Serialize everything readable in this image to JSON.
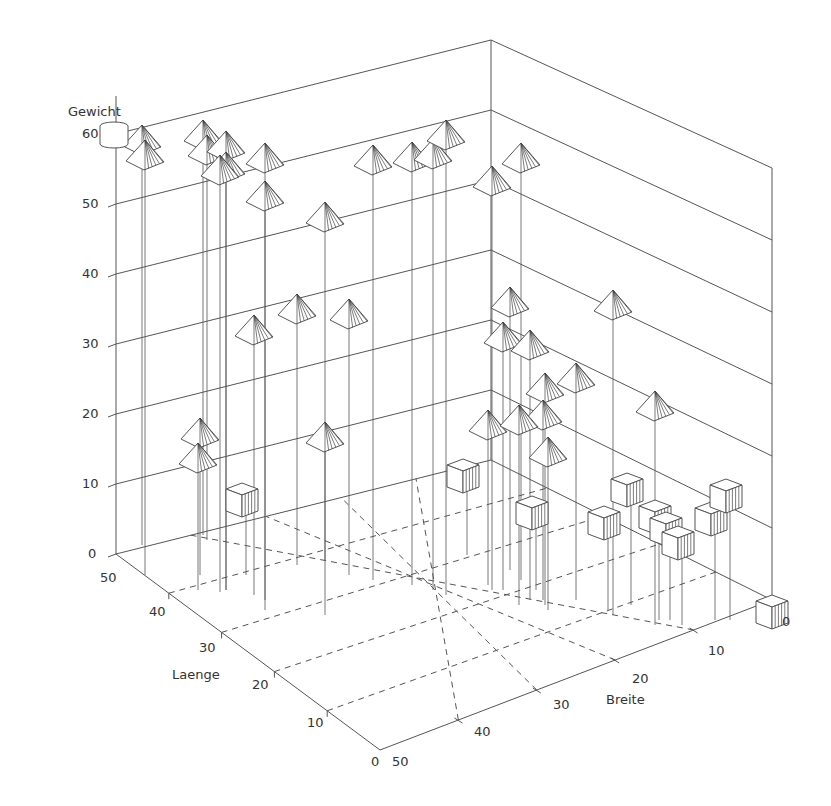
{
  "chart_data": {
    "type": "scatter3d",
    "title": "",
    "axes": {
      "z": {
        "label": "Gewicht",
        "range": [
          0,
          60
        ],
        "ticks": [
          0,
          10,
          20,
          30,
          40,
          50,
          60
        ]
      },
      "x": {
        "label": "Laenge",
        "range": [
          0,
          50
        ],
        "ticks": [
          0,
          10,
          20,
          30,
          40,
          50
        ]
      },
      "y": {
        "label": "Breite",
        "range": [
          0,
          50
        ],
        "ticks": [
          0,
          10,
          20,
          30,
          40,
          50
        ]
      }
    },
    "grid": "floor dashed grid, solid wall grid lines every 10 units",
    "legend": {
      "marker": "cylinder",
      "position": "top-left near Gewicht axis"
    },
    "series": [
      {
        "name": "pyramid",
        "marker": "pyramid",
        "points": [
          {
            "Laenge": 45,
            "Breite": 48,
            "Gewicht": 60
          },
          {
            "Laenge": 43,
            "Breite": 48,
            "Gewicht": 58
          },
          {
            "Laenge": 46,
            "Breite": 42,
            "Gewicht": 61
          },
          {
            "Laenge": 44,
            "Breite": 42,
            "Gewicht": 59
          },
          {
            "Laenge": 40,
            "Breite": 42,
            "Gewicht": 58
          },
          {
            "Laenge": 38,
            "Breite": 42,
            "Gewicht": 56
          },
          {
            "Laenge": 38,
            "Breite": 43,
            "Gewicht": 55
          },
          {
            "Laenge": 36,
            "Breite": 39,
            "Gewicht": 57
          },
          {
            "Laenge": 37,
            "Breite": 39,
            "Gewicht": 52
          },
          {
            "Laenge": 40,
            "Breite": 33,
            "Gewicht": 46
          },
          {
            "Laenge": 42,
            "Breite": 28,
            "Gewicht": 56
          },
          {
            "Laenge": 42,
            "Breite": 25,
            "Gewicht": 57
          },
          {
            "Laenge": 42,
            "Breite": 23,
            "Gewicht": 58
          },
          {
            "Laenge": 44,
            "Breite": 21,
            "Gewicht": 61
          },
          {
            "Laenge": 44,
            "Breite": 15,
            "Gewicht": 54
          },
          {
            "Laenge": 43,
            "Breite": 13,
            "Gewicht": 58
          },
          {
            "Laenge": 34,
            "Breite": 42,
            "Gewicht": 33
          },
          {
            "Laenge": 40,
            "Breite": 36,
            "Gewicht": 34
          },
          {
            "Laenge": 38,
            "Breite": 31,
            "Gewicht": 34
          },
          {
            "Laenge": 32,
            "Breite": 36,
            "Gewicht": 17
          },
          {
            "Laenge": 43,
            "Breite": 45,
            "Gewicht": 19
          },
          {
            "Laenge": 41,
            "Breite": 46,
            "Gewicht": 17
          },
          {
            "Laenge": 40,
            "Breite": 15,
            "Gewicht": 36
          },
          {
            "Laenge": 37,
            "Breite": 16,
            "Gewicht": 32
          },
          {
            "Laenge": 35,
            "Breite": 14,
            "Gewicht": 31
          },
          {
            "Laenge": 33,
            "Breite": 13,
            "Gewicht": 26
          },
          {
            "Laenge": 33,
            "Breite": 10,
            "Gewicht": 27
          },
          {
            "Laenge": 30,
            "Breite": 6,
            "Gewicht": 37
          },
          {
            "Laenge": 34,
            "Breite": 13,
            "Gewicht": 23
          },
          {
            "Laenge": 40,
            "Breite": 16,
            "Gewicht": 19
          },
          {
            "Laenge": 33,
            "Breite": 14,
            "Gewicht": 20
          },
          {
            "Laenge": 31,
            "Breite": 13,
            "Gewicht": 16
          },
          {
            "Laenge": 27,
            "Breite": 4,
            "Gewicht": 24
          }
        ]
      },
      {
        "name": "cube",
        "marker": "cube",
        "points": [
          {
            "Laenge": 40,
            "Breite": 42,
            "Gewicht": 10
          },
          {
            "Laenge": 48,
            "Breite": 18,
            "Gewicht": 10
          },
          {
            "Laenge": 38,
            "Breite": 14,
            "Gewicht": 9
          },
          {
            "Laenge": 33,
            "Breite": 6,
            "Gewicht": 13
          },
          {
            "Laenge": 30,
            "Breite": 9,
            "Gewicht": 10
          },
          {
            "Laenge": 28,
            "Breite": 5,
            "Gewicht": 11
          },
          {
            "Laenge": 27,
            "Breite": 5,
            "Gewicht": 10
          },
          {
            "Laenge": 25,
            "Breite": 5,
            "Gewicht": 9
          },
          {
            "Laenge": 22,
            "Breite": 2,
            "Gewicht": 11
          },
          {
            "Laenge": 25,
            "Breite": 1,
            "Gewicht": 13
          },
          {
            "Laenge": 0,
            "Breite": 0,
            "Gewicht": 1
          }
        ]
      }
    ]
  },
  "render": {
    "frame": {
      "floor": {
        "front": [
          380,
          750
        ],
        "left": [
          116,
          554
        ],
        "back": [
          491,
          460
        ],
        "right": [
          772,
          600
        ]
      },
      "walls_top": {
        "left": [
          116,
          134
        ],
        "back": [
          491,
          40
        ],
        "right": [
          772,
          168
        ]
      }
    },
    "z_ticks_screen": [
      {
        "label": "0",
        "x": 88,
        "y": 554
      },
      {
        "label": "10",
        "x": 82,
        "y": 484
      },
      {
        "label": "20",
        "x": 82,
        "y": 414
      },
      {
        "label": "30",
        "x": 82,
        "y": 344
      },
      {
        "label": "40",
        "x": 82,
        "y": 274
      },
      {
        "label": "50",
        "x": 82,
        "y": 204
      },
      {
        "label": "60",
        "x": 82,
        "y": 134
      }
    ],
    "laenge_ticks_screen": [
      {
        "label": "50",
        "x": 100,
        "y": 578
      },
      {
        "label": "40",
        "x": 149,
        "y": 612
      },
      {
        "label": "30",
        "x": 199,
        "y": 648
      },
      {
        "label": "20",
        "x": 252,
        "y": 685
      },
      {
        "label": "10",
        "x": 307,
        "y": 723
      },
      {
        "label": "0",
        "x": 371,
        "y": 762
      }
    ],
    "breite_ticks_screen": [
      {
        "label": "50",
        "x": 392,
        "y": 762
      },
      {
        "label": "40",
        "x": 474,
        "y": 732
      },
      {
        "label": "30",
        "x": 553,
        "y": 705
      },
      {
        "label": "20",
        "x": 632,
        "y": 679
      },
      {
        "label": "10",
        "x": 708,
        "y": 651
      },
      {
        "label": "0",
        "x": 782,
        "y": 622
      }
    ],
    "axis_labels_screen": {
      "Gewicht": {
        "x": 68,
        "y": 112
      },
      "Laenge": {
        "x": 172,
        "y": 675
      },
      "Breite": {
        "x": 606,
        "y": 700
      }
    },
    "pyramids_screen": [
      [
        142,
        125,
        545
      ],
      [
        145,
        140,
        575
      ],
      [
        203,
        120,
        535
      ],
      [
        207,
        135,
        540
      ],
      [
        226,
        131,
        590
      ],
      [
        226,
        152,
        590
      ],
      [
        220,
        155,
        592
      ],
      [
        265,
        143,
        610
      ],
      [
        265,
        181,
        600
      ],
      [
        325,
        202,
        560
      ],
      [
        373,
        145,
        580
      ],
      [
        412,
        142,
        585
      ],
      [
        433,
        139,
        590
      ],
      [
        446,
        120,
        595
      ],
      [
        492,
        166,
        590
      ],
      [
        521,
        143,
        580
      ],
      [
        254,
        315,
        595
      ],
      [
        297,
        294,
        565
      ],
      [
        349,
        299,
        575
      ],
      [
        325,
        422,
        615
      ],
      [
        200,
        418,
        575
      ],
      [
        198,
        443,
        590
      ],
      [
        510,
        287,
        570
      ],
      [
        503,
        322,
        590
      ],
      [
        530,
        330,
        600
      ],
      [
        545,
        373,
        605
      ],
      [
        576,
        363,
        600
      ],
      [
        613,
        290,
        615
      ],
      [
        543,
        400,
        600
      ],
      [
        488,
        410,
        585
      ],
      [
        519,
        405,
        605
      ],
      [
        548,
        437,
        610
      ],
      [
        655,
        391,
        625
      ]
    ],
    "cubes_screen": [
      [
        242,
        493,
        575
      ],
      [
        463,
        469,
        555
      ],
      [
        532,
        506,
        590
      ],
      [
        627,
        483,
        605
      ],
      [
        604,
        516,
        610
      ],
      [
        655,
        510,
        620
      ],
      [
        666,
        522,
        620
      ],
      [
        678,
        536,
        625
      ],
      [
        711,
        512,
        620
      ],
      [
        726,
        489,
        620
      ],
      [
        772,
        605,
        612
      ]
    ]
  }
}
